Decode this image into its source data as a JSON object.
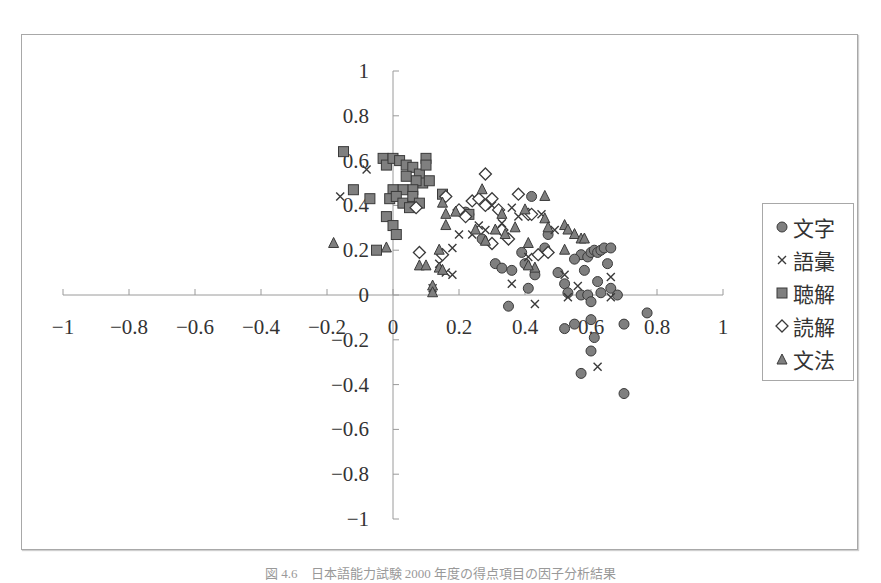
{
  "chart_data": {
    "type": "scatter",
    "title": "",
    "xlabel": "",
    "ylabel": "",
    "xlim": [
      -1,
      1
    ],
    "ylim": [
      -1,
      1
    ],
    "x_ticks": [
      "−1",
      "−0.8",
      "−0.6",
      "−0.4",
      "−0.2",
      "0",
      "0.2",
      "0.4",
      "0.6",
      "0.8",
      "1"
    ],
    "y_ticks": [
      "1",
      "0.8",
      "0.6",
      "0.4",
      "0.2",
      "0",
      "−0.2",
      "−0.4",
      "−0.6",
      "−0.8",
      "−1"
    ],
    "grid": false,
    "legend_position": "right",
    "axes_cross_at_origin": true,
    "series": [
      {
        "name": "文字",
        "marker": "circle",
        "points": [
          [
            0.42,
            0.44
          ],
          [
            0.27,
            0.25
          ],
          [
            0.22,
            0.37
          ],
          [
            0.23,
            0.36
          ],
          [
            0.31,
            0.14
          ],
          [
            0.33,
            0.12
          ],
          [
            0.36,
            0.11
          ],
          [
            0.4,
            0.14
          ],
          [
            0.41,
            0.03
          ],
          [
            0.43,
            0.09
          ],
          [
            0.35,
            -0.05
          ],
          [
            0.5,
            0.1
          ],
          [
            0.52,
            0.05
          ],
          [
            0.53,
            0.01
          ],
          [
            0.52,
            -0.15
          ],
          [
            0.55,
            -0.13
          ],
          [
            0.57,
            0.18
          ],
          [
            0.58,
            0.11
          ],
          [
            0.59,
            0.17
          ],
          [
            0.6,
            0.19
          ],
          [
            0.61,
            0.2
          ],
          [
            0.62,
            0.19
          ],
          [
            0.63,
            0.2
          ],
          [
            0.64,
            0.21
          ],
          [
            0.66,
            0.21
          ],
          [
            0.65,
            0.14
          ],
          [
            0.57,
            0.0
          ],
          [
            0.59,
            0.0
          ],
          [
            0.6,
            -0.03
          ],
          [
            0.62,
            0.06
          ],
          [
            0.63,
            0.01
          ],
          [
            0.66,
            0.03
          ],
          [
            0.68,
            0.0
          ],
          [
            0.6,
            -0.11
          ],
          [
            0.61,
            -0.19
          ],
          [
            0.6,
            -0.25
          ],
          [
            0.57,
            -0.35
          ],
          [
            0.7,
            -0.13
          ],
          [
            0.77,
            -0.08
          ],
          [
            0.7,
            -0.44
          ],
          [
            0.55,
            0.16
          ],
          [
            0.46,
            0.21
          ],
          [
            0.47,
            0.27
          ],
          [
            0.39,
            0.19
          ]
        ]
      },
      {
        "name": "語彙",
        "marker": "x",
        "points": [
          [
            -0.08,
            0.56
          ],
          [
            -0.16,
            0.44
          ],
          [
            0.12,
            0.03
          ],
          [
            0.14,
            0.14
          ],
          [
            0.18,
            0.09
          ],
          [
            0.18,
            0.21
          ],
          [
            0.2,
            0.27
          ],
          [
            0.26,
            0.31
          ],
          [
            0.28,
            0.29
          ],
          [
            0.3,
            0.4
          ],
          [
            0.33,
            0.32
          ],
          [
            0.36,
            0.39
          ],
          [
            0.38,
            0.35
          ],
          [
            0.41,
            0.17
          ],
          [
            0.43,
            -0.04
          ],
          [
            0.45,
            0.36
          ],
          [
            0.49,
            0.29
          ],
          [
            0.52,
            0.09
          ],
          [
            0.53,
            -0.01
          ],
          [
            0.56,
            0.04
          ],
          [
            0.62,
            -0.32
          ],
          [
            0.66,
            -0.01
          ],
          [
            0.66,
            0.08
          ],
          [
            0.16,
            0.1
          ],
          [
            0.24,
            0.27
          ],
          [
            0.36,
            0.05
          ]
        ]
      },
      {
        "name": "聴解",
        "marker": "square",
        "points": [
          [
            -0.15,
            0.64
          ],
          [
            -0.12,
            0.47
          ],
          [
            -0.07,
            0.43
          ],
          [
            -0.05,
            0.2
          ],
          [
            -0.03,
            0.61
          ],
          [
            -0.02,
            0.58
          ],
          [
            0.0,
            0.61
          ],
          [
            0.02,
            0.6
          ],
          [
            0.04,
            0.58
          ],
          [
            0.06,
            0.57
          ],
          [
            0.08,
            0.54
          ],
          [
            0.1,
            0.61
          ],
          [
            0.1,
            0.58
          ],
          [
            0.09,
            0.5
          ],
          [
            0.07,
            0.51
          ],
          [
            0.04,
            0.53
          ],
          [
            0.06,
            0.47
          ],
          [
            0.03,
            0.47
          ],
          [
            0.0,
            0.47
          ],
          [
            -0.01,
            0.43
          ],
          [
            0.01,
            0.44
          ],
          [
            0.03,
            0.41
          ],
          [
            0.06,
            0.44
          ],
          [
            0.08,
            0.41
          ],
          [
            -0.02,
            0.35
          ],
          [
            0.0,
            0.31
          ],
          [
            0.01,
            0.27
          ],
          [
            0.11,
            0.51
          ],
          [
            0.05,
            0.39
          ],
          [
            0.15,
            0.45
          ],
          [
            0.23,
            0.36
          ]
        ]
      },
      {
        "name": "読解",
        "marker": "diamond",
        "points": [
          [
            0.07,
            0.39
          ],
          [
            0.08,
            0.19
          ],
          [
            0.16,
            0.44
          ],
          [
            0.2,
            0.38
          ],
          [
            0.22,
            0.35
          ],
          [
            0.24,
            0.42
          ],
          [
            0.28,
            0.54
          ],
          [
            0.28,
            0.4
          ],
          [
            0.3,
            0.43
          ],
          [
            0.32,
            0.38
          ],
          [
            0.3,
            0.23
          ],
          [
            0.35,
            0.25
          ],
          [
            0.38,
            0.45
          ],
          [
            0.41,
            0.36
          ],
          [
            0.42,
            0.36
          ],
          [
            0.44,
            0.18
          ],
          [
            0.47,
            0.19
          ],
          [
            0.15,
            0.18
          ],
          [
            0.26,
            0.43
          ],
          [
            0.33,
            0.29
          ]
        ]
      },
      {
        "name": "文法",
        "marker": "triangle",
        "points": [
          [
            -0.18,
            0.23
          ],
          [
            -0.02,
            0.21
          ],
          [
            0.08,
            0.13
          ],
          [
            0.1,
            0.13
          ],
          [
            0.12,
            0.04
          ],
          [
            0.12,
            0.01
          ],
          [
            0.14,
            0.12
          ],
          [
            0.15,
            0.11
          ],
          [
            0.15,
            0.41
          ],
          [
            0.16,
            0.31
          ],
          [
            0.16,
            0.36
          ],
          [
            0.19,
            0.37
          ],
          [
            0.25,
            0.29
          ],
          [
            0.27,
            0.47
          ],
          [
            0.28,
            0.24
          ],
          [
            0.31,
            0.29
          ],
          [
            0.33,
            0.36
          ],
          [
            0.34,
            0.27
          ],
          [
            0.37,
            0.3
          ],
          [
            0.4,
            0.38
          ],
          [
            0.41,
            0.23
          ],
          [
            0.43,
            0.12
          ],
          [
            0.46,
            0.44
          ],
          [
            0.46,
            0.34
          ],
          [
            0.47,
            0.3
          ],
          [
            0.52,
            0.2
          ],
          [
            0.52,
            0.31
          ],
          [
            0.53,
            0.29
          ],
          [
            0.55,
            0.27
          ],
          [
            0.57,
            0.25
          ],
          [
            0.58,
            0.25
          ],
          [
            0.14,
            0.2
          ],
          [
            0.41,
            0.13
          ]
        ]
      }
    ]
  },
  "legend": {
    "items": [
      {
        "label": "文字",
        "marker": "circle"
      },
      {
        "label": "語彙",
        "marker": "x"
      },
      {
        "label": "聴解",
        "marker": "square"
      },
      {
        "label": "読解",
        "marker": "diamond"
      },
      {
        "label": "文法",
        "marker": "triangle"
      }
    ]
  },
  "colors": {
    "marker_fill": "#7f7f7f",
    "marker_stroke": "#3a3a3a",
    "axis": "#9a9a9a",
    "frame": "#a8a8a8",
    "text": "#333333"
  },
  "caption": "図 4.6　日本語能力試験 2000 年度の得点項目の因子分析結果"
}
